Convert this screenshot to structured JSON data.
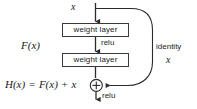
{
  "figure": {
    "type": "diagram",
    "background_color": "#ffffff",
    "line_color": "#3a3a3a",
    "text_color": "#1c1c1c"
  },
  "nodes": {
    "input_label": "x",
    "weight_layer_1": "weight layer",
    "weight_layer_2": "weight layer",
    "relu_middle": "relu",
    "relu_output": "relu",
    "plus_symbol": "+"
  },
  "annotations": {
    "residual_branch": "F(x)",
    "identity_branch": "identity",
    "identity_value": "x",
    "output_equation": {
      "lhs": "H(x)",
      "equals": "=",
      "rhs_term_1": "F(x)",
      "plus": "+",
      "rhs_term_2": "x",
      "full": "H(x) = F(x) + x"
    }
  },
  "icons": {
    "sum_node": "plus-circle-icon",
    "arrow_head": "arrow-down-icon"
  }
}
